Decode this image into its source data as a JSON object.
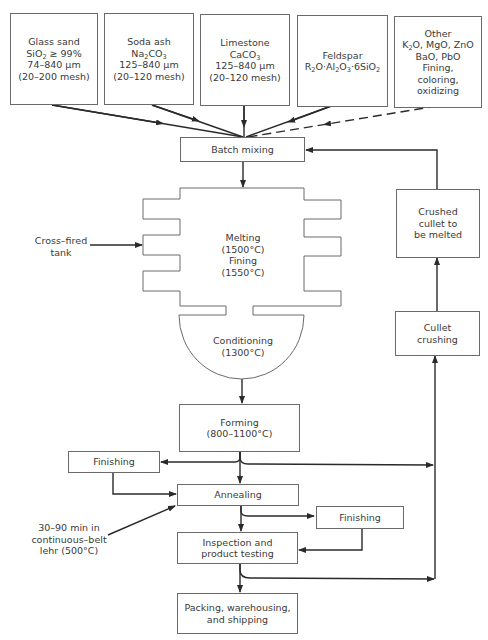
{
  "diagram": {
    "type": "process flow diagram"
  },
  "raw_materials": [
    {
      "name": "Glass sand",
      "lines": [
        "Glass sand",
        "SiO₂ ≥ 99%",
        "74–840 μm",
        "(20–200 mesh)"
      ]
    },
    {
      "name": "Soda ash",
      "lines": [
        "Soda ash",
        "Na₂CO₃",
        "125–840 μm",
        "(20–120 mesh)"
      ]
    },
    {
      "name": "Limestone",
      "lines": [
        "Limestone",
        "CaCO₃",
        "125–840 μm",
        "(20–120 mesh)"
      ]
    },
    {
      "name": "Feldspar",
      "lines": [
        "Feldspar",
        "R₂O·Al₂O₃·6SiO₂"
      ]
    },
    {
      "name": "Other",
      "lines": [
        "Other",
        "K₂O, MgO, ZnO",
        "BaO, PbO",
        "Fining,",
        "coloring,",
        "oxidizing"
      ]
    }
  ],
  "nodes": {
    "batch_mixing": "Batch mixing",
    "melting": [
      "Melting",
      "(1500°C)",
      "Fining",
      "(1550°C)"
    ],
    "conditioning": [
      "Conditioning",
      "(1300°C)"
    ],
    "forming": [
      "Forming",
      "(800–1100°C)"
    ],
    "finishing_left": "Finishing",
    "annealing": "Annealing",
    "finishing_right": "Finishing",
    "inspection": [
      "Inspection and",
      "product testing"
    ],
    "packing": [
      "Packing, warehousing,",
      "and shipping"
    ],
    "cullet_crushing": [
      "Cullet",
      "crushing"
    ],
    "crushed_cullet": [
      "Crushed",
      "cullet to",
      "be melted"
    ]
  },
  "annotations": {
    "cross_fired": [
      "Cross–fired",
      "tank"
    ],
    "lehr": [
      "30–90 min in",
      "continuous–belt",
      "lehr (500°C)"
    ]
  },
  "edges": [
    {
      "from": "Glass sand",
      "to": "Batch mixing",
      "style": "solid"
    },
    {
      "from": "Soda ash",
      "to": "Batch mixing",
      "style": "solid"
    },
    {
      "from": "Limestone",
      "to": "Batch mixing",
      "style": "solid"
    },
    {
      "from": "Feldspar",
      "to": "Batch mixing",
      "style": "solid"
    },
    {
      "from": "Other",
      "to": "Batch mixing",
      "style": "dashed"
    },
    {
      "from": "Batch mixing",
      "to": "Melting/Fining",
      "style": "solid"
    },
    {
      "from": "Cross–fired tank",
      "to": "Melting/Fining",
      "style": "solid"
    },
    {
      "from": "Conditioning",
      "to": "Forming",
      "style": "solid"
    },
    {
      "from": "Forming",
      "to": "Finishing (left)",
      "style": "solid"
    },
    {
      "from": "Forming",
      "to": "Annealing",
      "style": "solid"
    },
    {
      "from": "Forming",
      "to": "Cullet crushing",
      "style": "solid"
    },
    {
      "from": "Finishing (left)",
      "to": "Annealing",
      "style": "solid"
    },
    {
      "from": "30–90 min in continuous–belt lehr",
      "to": "Annealing",
      "style": "solid"
    },
    {
      "from": "Annealing",
      "to": "Finishing (right)",
      "style": "solid"
    },
    {
      "from": "Annealing",
      "to": "Inspection and product testing",
      "style": "solid"
    },
    {
      "from": "Finishing (right)",
      "to": "Inspection and product testing",
      "style": "solid"
    },
    {
      "from": "Inspection and product testing",
      "to": "Packing, warehousing, and shipping",
      "style": "solid"
    },
    {
      "from": "Inspection and product testing",
      "to": "Cullet crushing",
      "style": "solid"
    },
    {
      "from": "Cullet crushing",
      "to": "Crushed cullet to be melted",
      "style": "solid"
    },
    {
      "from": "Crushed cullet to be melted",
      "to": "Batch mixing",
      "style": "solid"
    }
  ]
}
